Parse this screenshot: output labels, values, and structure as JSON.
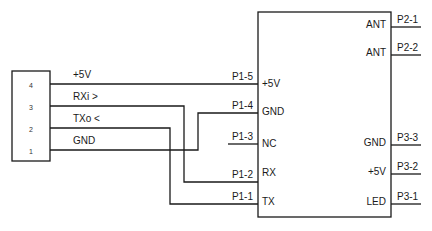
{
  "diagram": {
    "type": "schematic",
    "connector": {
      "pins": [
        {
          "number": "4",
          "signal": "+5V"
        },
        {
          "number": "3",
          "signal": "RXi >"
        },
        {
          "number": "2",
          "signal": "TXo <"
        },
        {
          "number": "1",
          "signal": "GND"
        }
      ]
    },
    "module": {
      "left_pins": [
        {
          "id": "P1-5",
          "label": "+5V"
        },
        {
          "id": "P1-4",
          "label": "GND"
        },
        {
          "id": "P1-3",
          "label": "NC"
        },
        {
          "id": "P1-2",
          "label": "RX"
        },
        {
          "id": "P1-1",
          "label": "TX"
        }
      ],
      "right_pins": [
        {
          "id": "P2-1",
          "label": "ANT"
        },
        {
          "id": "P2-2",
          "label": "ANT"
        },
        {
          "id": "P3-3",
          "label": "GND"
        },
        {
          "id": "P3-2",
          "label": "+5V"
        },
        {
          "id": "P3-1",
          "label": "LED"
        }
      ]
    },
    "connections": [
      {
        "from": "4",
        "to": "P1-5"
      },
      {
        "from": "3",
        "to": "P1-2"
      },
      {
        "from": "2",
        "to": "P1-1"
      },
      {
        "from": "1",
        "to": "P1-4"
      }
    ]
  }
}
